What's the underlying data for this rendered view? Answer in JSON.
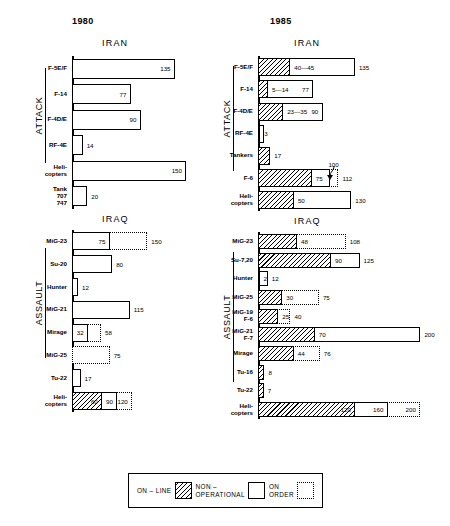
{
  "titles": {
    "year_left": "1980",
    "year_right": "1985"
  },
  "legend": {
    "items": [
      {
        "label_line1": "ON – LINE",
        "label_line2": "",
        "swatch": "hatched-square-icon",
        "key": "online"
      },
      {
        "label_line1": "NON –",
        "label_line2": "OPERATIONAL",
        "swatch": "outline-square-icon",
        "key": "nonoperational"
      },
      {
        "label_line1": "ON",
        "label_line2": "ORDER",
        "swatch": "dotted-square-icon",
        "key": "onorder"
      }
    ]
  },
  "chart_data": {
    "type": "bar",
    "orientation": "horizontal",
    "xlabel": "",
    "ylabel": "",
    "xlim": [
      0,
      200
    ],
    "grid": false,
    "legend_position": "bottom",
    "series": [
      {
        "name": "ON - LINE",
        "fill": "hatched"
      },
      {
        "name": "NON - OPERATIONAL",
        "fill": "outline"
      },
      {
        "name": "ON ORDER",
        "fill": "dotted"
      }
    ],
    "panels": [
      {
        "year": "1980",
        "country": "IRAN",
        "group": "ATTACK",
        "rows": [
          {
            "label": [
              "F-5E/F"
            ],
            "online": 0,
            "nonoperational": 135,
            "onorder": 0,
            "labels": [
              {
                "text": "135",
                "pos": "inside-right"
              }
            ]
          },
          {
            "label": [
              "F-14"
            ],
            "online": 0,
            "nonoperational": 77,
            "onorder": 0,
            "labels": [
              {
                "text": "77",
                "pos": "inside-right"
              }
            ]
          },
          {
            "label": [
              "F-4D/E"
            ],
            "online": 0,
            "nonoperational": 90,
            "onorder": 0,
            "labels": [
              {
                "text": "90",
                "pos": "inside-right"
              }
            ]
          },
          {
            "label": [
              "RF-4E"
            ],
            "online": 0,
            "nonoperational": 14,
            "onorder": 0,
            "labels": [
              {
                "text": "14",
                "pos": "outside"
              }
            ]
          },
          {
            "label": [
              "Heli-",
              "copters"
            ],
            "online": 0,
            "nonoperational": 150,
            "onorder": 0,
            "labels": [
              {
                "text": "150",
                "pos": "inside-right"
              }
            ]
          },
          {
            "label": [
              "Tank",
              "707",
              "747"
            ],
            "online": 0,
            "nonoperational": 20,
            "onorder": 0,
            "labels": [
              {
                "text": "20",
                "pos": "outside"
              }
            ]
          }
        ]
      },
      {
        "year": "1980",
        "country": "IRAQ",
        "group": "ASSAULT",
        "rows": [
          {
            "label": [
              "MiG-23"
            ],
            "online": 0,
            "nonoperational": 75,
            "onorder": 150,
            "labels": [
              {
                "text": "75",
                "pos": "inside-right"
              },
              {
                "text": "150",
                "pos": "outside"
              }
            ]
          },
          {
            "label": [
              "Su-20"
            ],
            "online": 0,
            "nonoperational": 80,
            "onorder": 0,
            "labels": [
              {
                "text": "80",
                "pos": "outside"
              }
            ]
          },
          {
            "label": [
              "Hunter"
            ],
            "online": 0,
            "nonoperational": 12,
            "onorder": 0,
            "labels": [
              {
                "text": "12",
                "pos": "outside"
              }
            ]
          },
          {
            "label": [
              "MiG-21"
            ],
            "online": 0,
            "nonoperational": 115,
            "onorder": 0,
            "labels": [
              {
                "text": "115",
                "pos": "outside"
              }
            ]
          },
          {
            "label": [
              "Mirage"
            ],
            "online": 0,
            "nonoperational": 32,
            "onorder": 58,
            "labels": [
              {
                "text": "32",
                "pos": "inside-right"
              },
              {
                "text": "58",
                "pos": "outside"
              }
            ]
          },
          {
            "label": [
              "MiG-25"
            ],
            "online": 0,
            "nonoperational": 0,
            "onorder": 75,
            "labels": [
              {
                "text": "75",
                "pos": "outside"
              }
            ]
          },
          {
            "label": [
              "Tu-22"
            ],
            "online": 0,
            "nonoperational": 17,
            "onorder": 0,
            "labels": [
              {
                "text": "17",
                "pos": "outside"
              }
            ]
          },
          {
            "label": [
              "Heli-",
              "copters"
            ],
            "online": 60,
            "nonoperational": 90,
            "onorder": 120,
            "labels": [
              {
                "text": "60",
                "pos": "inside-right-online"
              },
              {
                "text": "90",
                "pos": "inside-right-nonop"
              },
              {
                "text": "120",
                "pos": "inside-right-onorder"
              }
            ]
          }
        ]
      },
      {
        "year": "1985",
        "country": "IRAN",
        "group": "ATTACK",
        "rows": [
          {
            "label": [
              "F-5E/F"
            ],
            "online": 45,
            "nonoperational": 135,
            "onorder": 0,
            "labels": [
              {
                "text": "40—45",
                "pos": "after-online"
              },
              {
                "text": "135",
                "pos": "outside"
              }
            ]
          },
          {
            "label": [
              "F-14"
            ],
            "online": 14,
            "nonoperational": 77,
            "onorder": 0,
            "labels": [
              {
                "text": "5—14",
                "pos": "after-online"
              },
              {
                "text": "77",
                "pos": "mid"
              }
            ]
          },
          {
            "label": [
              "F-4D/E"
            ],
            "online": 35,
            "nonoperational": 90,
            "onorder": 0,
            "labels": [
              {
                "text": "23—35",
                "pos": "after-online"
              },
              {
                "text": "90",
                "pos": "mid"
              }
            ]
          },
          {
            "label": [
              "RF-4E"
            ],
            "online": 3,
            "nonoperational": 8,
            "onorder": 0,
            "labels": [
              {
                "text": "3",
                "pos": "after-online"
              }
            ]
          },
          {
            "label": [
              "Tankers"
            ],
            "online": 17,
            "nonoperational": 0,
            "onorder": 0,
            "labels": [
              {
                "text": "17",
                "pos": "outside"
              }
            ]
          },
          {
            "label": [
              "F-6"
            ],
            "online": 75,
            "nonoperational": 100,
            "onorder": 112,
            "labels": [
              {
                "text": "75",
                "pos": "after-online"
              },
              {
                "text": "100",
                "pos": "callout"
              },
              {
                "text": "112",
                "pos": "outside"
              }
            ]
          },
          {
            "label": [
              "Heli-",
              "copters"
            ],
            "online": 50,
            "nonoperational": 130,
            "onorder": 0,
            "labels": [
              {
                "text": "50",
                "pos": "after-online"
              },
              {
                "text": "130",
                "pos": "outside"
              }
            ]
          }
        ]
      },
      {
        "year": "1985",
        "country": "IRAQ",
        "group": "ASSAULT",
        "rows": [
          {
            "label": [
              "MiG-23"
            ],
            "online": 48,
            "nonoperational": 0,
            "onorder": 108,
            "labels": [
              {
                "text": "48",
                "pos": "after-online"
              },
              {
                "text": "108",
                "pos": "outside"
              }
            ]
          },
          {
            "label": [
              "Su-7,20"
            ],
            "online": 90,
            "nonoperational": 125,
            "onorder": 0,
            "labels": [
              {
                "text": "90",
                "pos": "after-online"
              },
              {
                "text": "125",
                "pos": "outside"
              }
            ]
          },
          {
            "label": [
              "Hunter"
            ],
            "online": 2,
            "nonoperational": 12,
            "onorder": 0,
            "labels": [
              {
                "text": "2",
                "pos": "after-online"
              },
              {
                "text": "12",
                "pos": "outside"
              }
            ]
          },
          {
            "label": [
              "MiG-25"
            ],
            "online": 30,
            "nonoperational": 0,
            "onorder": 75,
            "labels": [
              {
                "text": "30",
                "pos": "after-online"
              },
              {
                "text": "75",
                "pos": "outside"
              }
            ]
          },
          {
            "label": [
              "MiG-19",
              "F-6"
            ],
            "online": 25,
            "nonoperational": 0,
            "onorder": 40,
            "labels": [
              {
                "text": "25",
                "pos": "after-online"
              },
              {
                "text": "40",
                "pos": "outside"
              }
            ]
          },
          {
            "label": [
              "MiG-21",
              "F-7"
            ],
            "online": 70,
            "nonoperational": 200,
            "onorder": 0,
            "labels": [
              {
                "text": "70",
                "pos": "after-online"
              },
              {
                "text": "200",
                "pos": "outside"
              }
            ]
          },
          {
            "label": [
              "Mirage"
            ],
            "online": 44,
            "nonoperational": 0,
            "onorder": 76,
            "labels": [
              {
                "text": "44",
                "pos": "after-online"
              },
              {
                "text": "76",
                "pos": "outside"
              }
            ]
          },
          {
            "label": [
              "Tu-16"
            ],
            "online": 8,
            "nonoperational": 0,
            "onorder": 0,
            "labels": [
              {
                "text": "8",
                "pos": "outside"
              }
            ]
          },
          {
            "label": [
              "Tu-22"
            ],
            "online": 7,
            "nonoperational": 0,
            "onorder": 0,
            "labels": [
              {
                "text": "7",
                "pos": "outside"
              }
            ]
          },
          {
            "label": [
              "Heli-",
              "copters"
            ],
            "online": 120,
            "nonoperational": 160,
            "onorder": 200,
            "labels": [
              {
                "text": "120",
                "pos": "inside-right-online"
              },
              {
                "text": "160",
                "pos": "inside-right-nonop"
              },
              {
                "text": "200",
                "pos": "inside-right-onorder"
              }
            ]
          }
        ]
      }
    ]
  }
}
